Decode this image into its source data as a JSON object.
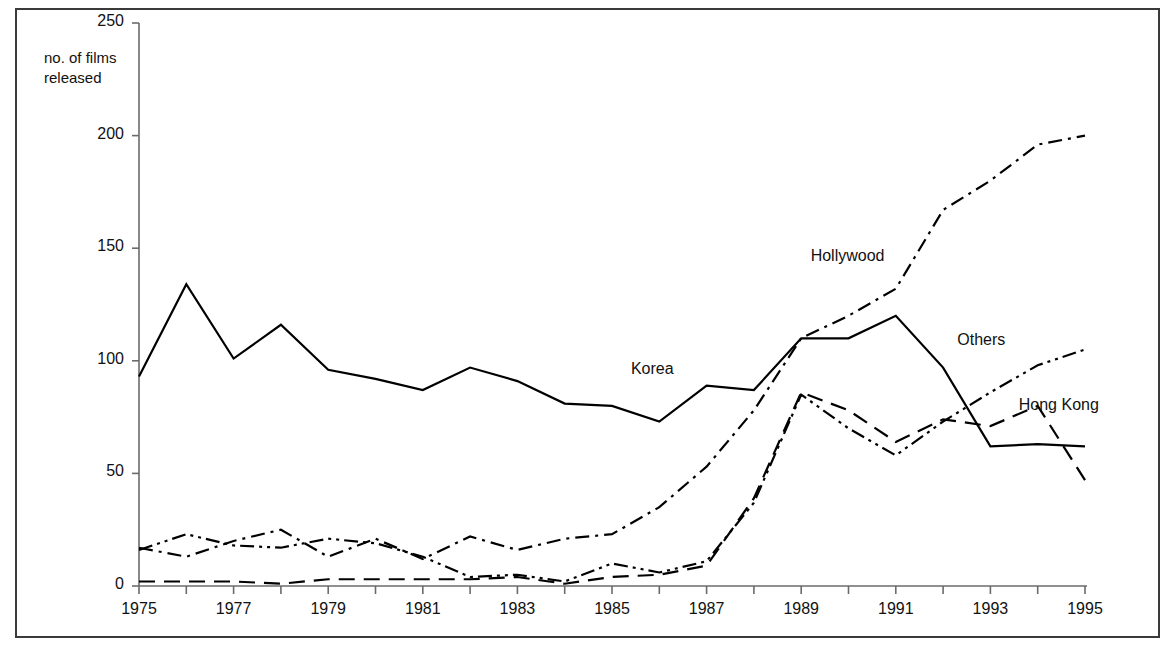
{
  "chart_data": {
    "type": "line",
    "title": "",
    "subtitle": "",
    "xlabel": "",
    "ylabel": "no. of films released",
    "ylabel_lines": [
      "no. of films",
      "released"
    ],
    "xlim": [
      1975,
      1995
    ],
    "ylim": [
      0,
      250
    ],
    "grid": false,
    "legend_position": "inline-annotations",
    "y_ticks": [
      0,
      50,
      100,
      150,
      200,
      250
    ],
    "y_tick_labels": [
      "0",
      "50",
      "100",
      "150",
      "200",
      "250"
    ],
    "x_ticks": [
      1975,
      1976,
      1977,
      1978,
      1979,
      1980,
      1981,
      1982,
      1983,
      1984,
      1985,
      1986,
      1987,
      1988,
      1989,
      1990,
      1991,
      1992,
      1993,
      1994,
      1995
    ],
    "x_tick_labels_shown": [
      "1975",
      "1977",
      "1979",
      "1981",
      "1983",
      "1985",
      "1987",
      "1989",
      "1991",
      "1993",
      "1995"
    ],
    "x": [
      1975,
      1976,
      1977,
      1978,
      1979,
      1980,
      1981,
      1982,
      1983,
      1984,
      1985,
      1986,
      1987,
      1988,
      1989,
      1990,
      1991,
      1992,
      1993,
      1994,
      1995
    ],
    "series": [
      {
        "name": "Korea",
        "style": "solid",
        "color": "#000000",
        "label_x": 1985.4,
        "label_y": 96,
        "values": [
          93,
          134,
          101,
          116,
          96,
          92,
          87,
          97,
          91,
          81,
          80,
          73,
          89,
          87,
          110,
          110,
          120,
          97,
          62,
          63,
          62
        ]
      },
      {
        "name": "Hollywood",
        "style": "dash-dot",
        "color": "#000000",
        "label_x": 1989.2,
        "label_y": 146,
        "values": [
          17,
          13,
          20,
          25,
          13,
          21,
          12,
          22,
          16,
          21,
          23,
          35,
          53,
          78,
          110,
          120,
          132,
          167,
          180,
          196,
          200
        ]
      },
      {
        "name": "Others",
        "style": "dash-dot-dot",
        "color": "#000000",
        "label_x": 1992.3,
        "label_y": 109,
        "values": [
          16,
          23,
          18,
          17,
          21,
          19,
          13,
          4,
          5,
          2,
          10,
          6,
          11,
          37,
          85,
          70,
          58,
          73,
          86,
          98,
          105
        ]
      },
      {
        "name": "Hong Kong",
        "style": "long-dash",
        "color": "#000000",
        "label_x": 1993.6,
        "label_y": 80,
        "values": [
          2,
          2,
          2,
          1,
          3,
          3,
          3,
          3,
          4,
          1,
          4,
          5,
          9,
          39,
          86,
          78,
          64,
          74,
          71,
          80,
          47
        ]
      }
    ]
  },
  "axis": {
    "y_label_line1": "no. of films",
    "y_label_line2": "released"
  },
  "labels": {
    "korea": "Korea",
    "hollywood": "Hollywood",
    "others": "Others",
    "hong_kong": "Hong Kong"
  }
}
